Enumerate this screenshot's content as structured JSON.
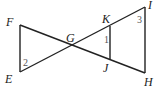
{
  "diagram": {
    "title": "",
    "points": {
      "F": {
        "label": "F",
        "x": 20,
        "y": 25
      },
      "E": {
        "label": "E",
        "x": 20,
        "y": 72
      },
      "G": {
        "label": "G",
        "x": 72,
        "y": 45
      },
      "K": {
        "label": "K",
        "x": 110,
        "y": 26
      },
      "J": {
        "label": "J",
        "x": 110,
        "y": 59
      },
      "I": {
        "label": "I",
        "x": 145,
        "y": 7
      },
      "H": {
        "label": "H",
        "x": 145,
        "y": 73
      }
    },
    "segments": [
      "FE",
      "FH",
      "EI",
      "KJ",
      "IH"
    ],
    "angles": {
      "a1": {
        "label": "1",
        "at": "K"
      },
      "a2": {
        "label": "2",
        "at": "E"
      },
      "a3": {
        "label": "3",
        "at": "I"
      }
    }
  }
}
